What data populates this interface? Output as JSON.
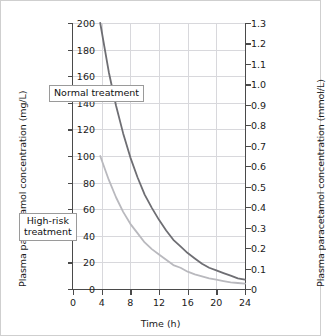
{
  "chart_data": {
    "type": "line",
    "title": "",
    "xlabel": "Time (h)",
    "ylabel": "Plasma paracetamol concentration (mg/L)",
    "ylabel_right": "Plasma paracetamol concentration (mmol/L)",
    "xlim": [
      0,
      24
    ],
    "ylim": [
      0,
      200
    ],
    "ylim_right": [
      0,
      1.3
    ],
    "grid": true,
    "legend": "annotations-inline",
    "xticks": [
      0,
      4,
      8,
      12,
      16,
      20,
      24
    ],
    "xtick_labels": [
      "0",
      "4",
      "8",
      "12",
      "16",
      "20",
      "24"
    ],
    "yticks": [
      0,
      20,
      40,
      60,
      80,
      100,
      120,
      140,
      160,
      180,
      200
    ],
    "ytick_labels": [
      "0",
      "20",
      "40",
      "60",
      "80",
      "100",
      "120",
      "140",
      "160",
      "180",
      "200"
    ],
    "yticks_right": [
      0,
      0.1,
      0.2,
      0.3,
      0.4,
      0.5,
      0.6,
      0.7,
      0.8,
      0.9,
      1.0,
      1.1,
      1.2,
      1.3
    ],
    "ytick_labels_right": [
      "0",
      "0.1",
      "0.2",
      "0.3",
      "0.4",
      "0.5",
      "0.6",
      "0.7",
      "0.8",
      "0.9",
      "1.0",
      "1.1",
      "1.2",
      "1.3"
    ],
    "annotations": [
      {
        "name": "normal-treatment",
        "text": "Normal treatment"
      },
      {
        "name": "high-risk-treatment",
        "line1": "High-risk",
        "line2": "treatment"
      }
    ],
    "series": [
      {
        "name": "Normal treatment",
        "color": "#6e6e73",
        "x": [
          3.8,
          5,
          6,
          7,
          8,
          9,
          10,
          11,
          12,
          13,
          14,
          15,
          16,
          17,
          18,
          19,
          20,
          21,
          22,
          23,
          24
        ],
        "y": [
          200,
          163,
          138,
          117,
          99,
          84,
          71,
          61,
          52,
          44,
          37,
          32,
          27,
          23,
          19,
          16,
          14,
          12,
          10,
          8,
          7
        ]
      },
      {
        "name": "High-risk treatment",
        "color": "#b9b9be",
        "x": [
          3.8,
          5,
          6,
          7,
          8,
          9,
          10,
          11,
          12,
          13,
          14,
          15,
          16,
          17,
          18,
          19,
          20,
          21,
          22,
          23,
          24
        ],
        "y": [
          100,
          82,
          69,
          58,
          49,
          42,
          35,
          30,
          26,
          22,
          18,
          16,
          13,
          11,
          9.5,
          8,
          7,
          6,
          5,
          4.5,
          4
        ]
      }
    ]
  },
  "colors": {
    "normal_treatment": "#6e6e73",
    "high_risk_treatment": "#b9b9be",
    "grid": "#d8d8dc",
    "axis": "#4a4a4a",
    "frame": "#cfcfcf"
  }
}
